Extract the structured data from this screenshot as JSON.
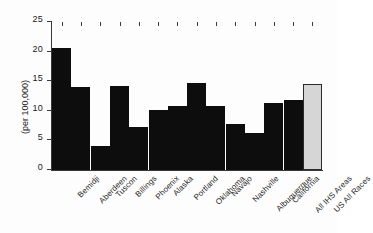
{
  "chart_data": {
    "type": "bar",
    "title": "",
    "xlabel": "",
    "ylabel": "(per 100,000)",
    "ylim": [
      0,
      25
    ],
    "yticks": [
      0,
      5,
      10,
      15,
      20,
      25
    ],
    "ytick_labels": [
      "0",
      "5",
      "10",
      "15",
      "20",
      "25"
    ],
    "grid": false,
    "legend": "none",
    "categories": [
      "Bemidji",
      "Aberdeen",
      "Tuscon",
      "Billings",
      "Phoenix",
      "Alaska",
      "Portland",
      "Oklahoma",
      "Navajo",
      "Nashville",
      "Albuquerque",
      "California",
      "All IHS Areas",
      "US All Races"
    ],
    "values": [
      20.6,
      14.1,
      4.1,
      14.2,
      7.2,
      10.2,
      10.8,
      14.7,
      10.8,
      7.8,
      6.3,
      11.4,
      11.9,
      14.6
    ],
    "bar_colors": [
      "#0d0d0d",
      "#0d0d0d",
      "#0d0d0d",
      "#0d0d0d",
      "#0d0d0d",
      "#0d0d0d",
      "#0d0d0d",
      "#0d0d0d",
      "#0d0d0d",
      "#0d0d0d",
      "#0d0d0d",
      "#0d0d0d",
      "#0d0d0d",
      "#d6d6d6"
    ],
    "highlight_index": 13,
    "colors": {
      "bar_primary": "#0d0d0d",
      "bar_highlight_fill": "#d6d6d6",
      "bar_highlight_border": "#2b2b2b",
      "axis": "#3a3a3a",
      "text": "#1a1a1a",
      "background": "#ffffff"
    }
  }
}
